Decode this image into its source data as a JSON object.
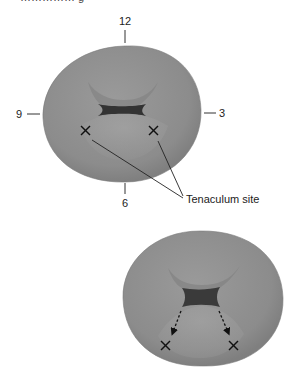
{
  "caption_fragment": "…………… g",
  "top_view": {
    "clock_labels": {
      "twelve": "12",
      "three": "3",
      "six": "6",
      "nine": "9"
    },
    "callout": "Tenaculum site",
    "markers": [
      {
        "symbol": "×"
      },
      {
        "symbol": "×"
      }
    ]
  },
  "bottom_view": {
    "markers": [
      {
        "symbol": "×"
      },
      {
        "symbol": "×"
      }
    ],
    "arrows": "dashed arrows from os edge to tenaculum sites"
  },
  "colors": {
    "tissue": "#8f8f8f",
    "tissue_light": "#a4a4a4",
    "os": "#3a3a3a",
    "line": "#222222"
  }
}
